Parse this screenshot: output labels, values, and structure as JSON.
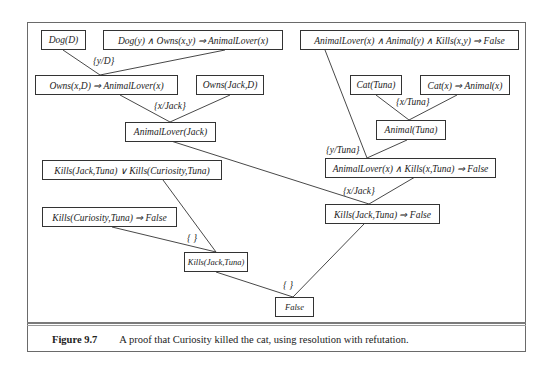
{
  "nodes": {
    "dog_d": "Dog(D)",
    "dog_owns_rule": "Dog(y)  ∧  Owns(x,y)  ⇒ AnimalLover(x)",
    "lover_animal_kills_rule": "AnimalLover(x)  ∧ Animal(y)  ∧ Kills(x,y) ⇒ False",
    "owns_rule": "Owns(x,D)  ⇒ AnimalLover(x)",
    "owns_jack_d": "Owns(Jack,D)",
    "cat_tuna": "Cat(Tuna)",
    "cat_animal_rule": "Cat(x)  ⇒ Animal(x)",
    "animallover_jack": "AnimalLover(Jack)",
    "animal_tuna": "Animal(Tuna)",
    "kills_disjunction": "Kills(Jack,Tuna)  ∨ Kills(Curiosity,Tuna)",
    "lover_kills_tuna_rule": "AnimalLover(x)  ∧ Kills(x,Tuna)  ⇒ False",
    "kills_curiosity_false": "Kills(Curiosity,Tuna)  ⇒ False",
    "kills_jack_false": "Kills(Jack,Tuna)  ⇒ False",
    "kills_jack_tuna": "Kills(Jack,Tuna)",
    "false": "False"
  },
  "substitutions": {
    "y_d": "{y/D}",
    "x_jack_1": "{x/Jack}",
    "x_tuna": "{x/Tuna}",
    "y_tuna": "{y/Tuna}",
    "x_jack_2": "{x/Jack}",
    "empty_1": "{ }",
    "empty_2": "{ }"
  },
  "caption": {
    "label": "Figure 9.7",
    "text": "A proof that Curiosity killed the cat, using resolution with refutation."
  },
  "colors": {
    "line": "#333333",
    "frame": "#6a6a6a"
  }
}
